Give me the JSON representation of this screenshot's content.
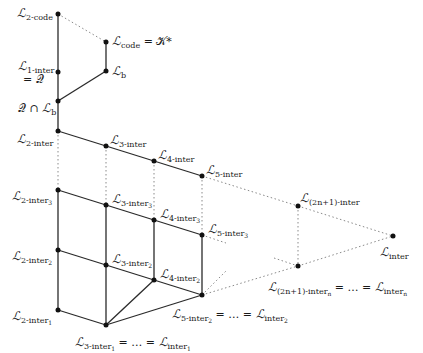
{
  "diagram": {
    "type": "lattice",
    "nodes": [
      {
        "id": "2-code",
        "x": 58,
        "y": 14,
        "label": "L_2-code"
      },
      {
        "id": "code",
        "x": 106,
        "y": 42,
        "label": "L_code = K*"
      },
      {
        "id": "1-inter",
        "x": 58,
        "y": 72,
        "label": "L_1-inter = Q"
      },
      {
        "id": "b",
        "x": 106,
        "y": 71,
        "label": "L_b"
      },
      {
        "id": "QcapLb",
        "x": 58,
        "y": 101,
        "label": "Q ∩ L_b"
      },
      {
        "id": "2-inter",
        "x": 58,
        "y": 131,
        "label": "L_2-inter"
      },
      {
        "id": "3-inter",
        "x": 106,
        "y": 146,
        "label": "L_3-inter"
      },
      {
        "id": "4-inter",
        "x": 154,
        "y": 161,
        "label": "L_4-inter"
      },
      {
        "id": "5-inter",
        "x": 202,
        "y": 176,
        "label": "L_5-inter"
      },
      {
        "id": "2-inter3",
        "x": 58,
        "y": 190,
        "label": "L_2-inter3"
      },
      {
        "id": "3-inter3",
        "x": 106,
        "y": 205,
        "label": "L_3-inter3"
      },
      {
        "id": "4-inter3",
        "x": 154,
        "y": 220,
        "label": "L_4-inter3"
      },
      {
        "id": "5-inter3",
        "x": 202,
        "y": 235,
        "label": "L_5-inter3"
      },
      {
        "id": "2-inter2",
        "x": 58,
        "y": 250,
        "label": "L_2-inter2"
      },
      {
        "id": "3-inter2",
        "x": 106,
        "y": 265,
        "label": "L_3-inter2"
      },
      {
        "id": "4-inter2",
        "x": 154,
        "y": 280,
        "label": "L_4-inter2"
      },
      {
        "id": "5-inter2",
        "x": 202,
        "y": 295,
        "label": "L_5-inter2 = ... = L_inter2"
      },
      {
        "id": "2-inter1",
        "x": 58,
        "y": 310,
        "label": "L_2-inter1"
      },
      {
        "id": "3-inter1",
        "x": 106,
        "y": 325,
        "label": "L_3-inter1 = ... = L_inter1"
      },
      {
        "id": "(2n+1)-inter",
        "x": 298,
        "y": 206,
        "label": "L_(2n+1)-inter"
      },
      {
        "id": "(2n+1)-intern",
        "x": 298,
        "y": 266,
        "label": "L_(2n+1)-intern = ... = L_intern"
      },
      {
        "id": "inter",
        "x": 393,
        "y": 236,
        "label": "L_inter"
      }
    ],
    "labels": {
      "n2code": {
        "L": "ℒ",
        "sub": "2-code"
      },
      "ncode": {
        "L": "ℒ",
        "sub": "code",
        "eq": " = 𝒦*"
      },
      "n1inter": {
        "L": "ℒ",
        "sub": "1-inter",
        "eq2": "= 𝒬"
      },
      "nb": {
        "L": "ℒ",
        "sub": "b"
      },
      "nqcap": {
        "Q": "𝒬 ∩ ",
        "L": "ℒ",
        "sub": "b"
      },
      "n2inter": {
        "L": "ℒ",
        "sub": "2-inter"
      },
      "n3inter": {
        "L": "ℒ",
        "sub": "3-inter"
      },
      "n4inter": {
        "L": "ℒ",
        "sub": "4-inter"
      },
      "n5inter": {
        "L": "ℒ",
        "sub": "5-inter"
      },
      "n2inter3": {
        "L": "ℒ",
        "sub": "2-inter",
        "subsub": "3"
      },
      "n3inter3": {
        "L": "ℒ",
        "sub": "3-inter",
        "subsub": "3"
      },
      "n4inter3": {
        "L": "ℒ",
        "sub": "4-inter",
        "subsub": "3"
      },
      "n5inter3": {
        "L": "ℒ",
        "sub": "5-inter",
        "subsub": "3"
      },
      "n2inter2": {
        "L": "ℒ",
        "sub": "2-inter",
        "subsub": "2"
      },
      "n3inter2": {
        "L": "ℒ",
        "sub": "3-inter",
        "subsub": "2"
      },
      "n4inter2": {
        "L": "ℒ",
        "sub": "4-inter",
        "subsub": "2"
      },
      "n5inter2": {
        "L": "ℒ",
        "sub": "5-inter",
        "subsub": "2",
        "eq": " = … = ",
        "L2": "ℒ",
        "sub2": "inter",
        "subsub2": "2"
      },
      "n2inter1": {
        "L": "ℒ",
        "sub": "2-inter",
        "subsub": "1"
      },
      "n3inter1": {
        "L": "ℒ",
        "sub": "3-inter",
        "subsub": "1",
        "eq": " = … = ",
        "L2": "ℒ",
        "sub2": "inter",
        "subsub2": "1"
      },
      "n2n1inter": {
        "L": "ℒ",
        "sub": "(2n+1)-inter"
      },
      "n2n1intern": {
        "L": "ℒ",
        "sub": "(2n+1)-inter",
        "subsub": "n",
        "eq": " = … = ",
        "L2": "ℒ",
        "sub2": "inter",
        "subsub2": "n"
      },
      "ninter": {
        "L": "ℒ",
        "sub": "inter"
      }
    },
    "colors": {
      "solid_edge": "#2a2a2a",
      "dotted_edge": "#8a8a8a",
      "node": "#111111"
    }
  }
}
